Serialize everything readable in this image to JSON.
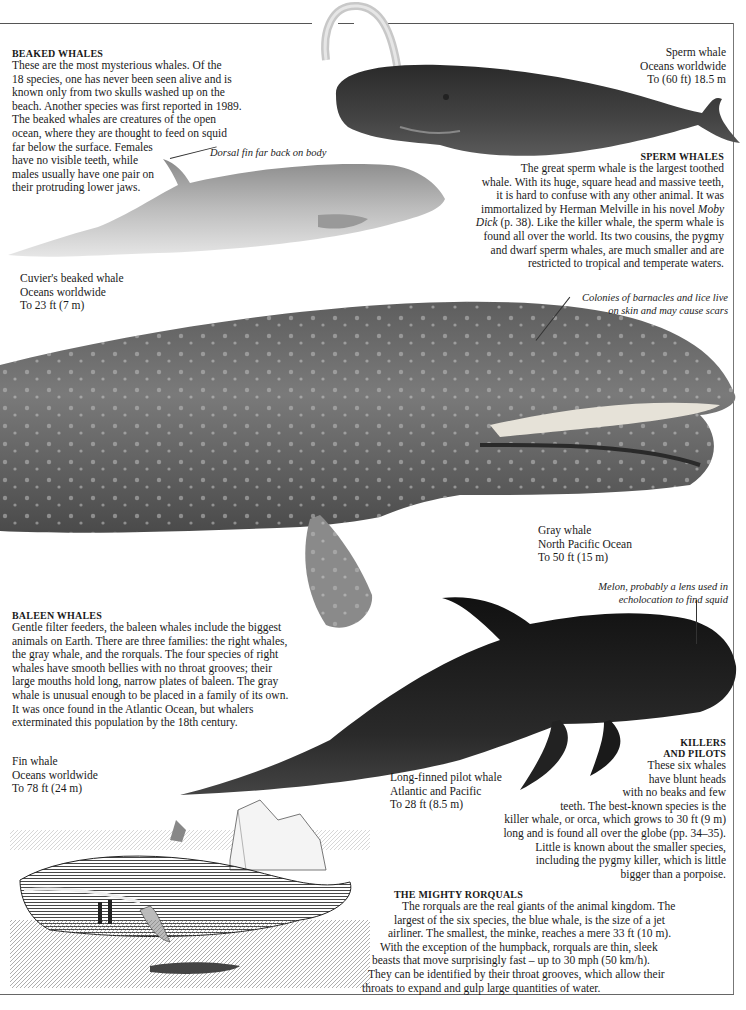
{
  "sections": {
    "beaked": {
      "heading": "BEAKED WHALES",
      "lines": [
        "These are the most mysterious whales. Of the",
        "18 species, one has never been seen alive and is",
        "known only from two skulls washed up on the",
        "beach. Another species was first reported in 1989.",
        "The beaked whales are creatures of the open",
        "ocean, where they are thought to feed on squid",
        "far below the surface. Females",
        "have no visible teeth, while",
        "males usually have one pair on",
        "their protruding lower jaws."
      ]
    },
    "sperm": {
      "heading": "SPERM WHALES",
      "lines": [
        "The great sperm whale is the largest toothed",
        "whale. With its huge, square head and massive teeth,",
        "it is hard to confuse with any other animal. It was",
        "immortalized by Herman Melville in his novel",
        "Moby",
        "Dick",
        " (p. 38). Like the killer whale, the sperm whale is",
        "found all over the world. Its two cousins, the pygmy",
        "and dwarf sperm whales, are much smaller and are",
        "restricted to tropical and temperate waters."
      ]
    },
    "baleen": {
      "heading": "BALEEN WHALES",
      "lines": [
        "Gentle filter feeders, the baleen whales include the biggest",
        "animals on Earth. There are three families: the right whales,",
        "the gray whale, and the rorquals. The four species of right",
        "whales have smooth bellies with no throat grooves; their",
        "large mouths hold long, narrow plates of baleen. The gray",
        "whale is unusual enough to be placed in a family of its own.",
        "It was once found in the Atlantic Ocean, but whalers",
        "exterminated this population by the 18th century."
      ]
    },
    "killers": {
      "heading_1": "KILLERS",
      "heading_2": "AND PILOTS",
      "lines": [
        "These six whales",
        "have blunt heads",
        "with no beaks and few",
        "teeth. The best-known species is the",
        "killer whale, or orca, which grows to 30 ft (9 m)",
        "long and is found all over the globe (pp. 34–35).",
        "Little is known about the smaller species,",
        "including the pygmy killer, which is little",
        "bigger than a porpoise."
      ]
    },
    "rorquals": {
      "heading": "THE MIGHTY RORQUALS",
      "lines": [
        "The rorquals are the real giants of the animal kingdom. The",
        "largest of the six species, the blue whale, is the size of a jet",
        "airliner. The smallest, the minke, reaches a mere 33 ft (10 m).",
        "With the exception of the humpback, rorquals are thin, sleek",
        "beasts that move surprisingly fast – up to 30 mph (50 km/h).",
        "They can be identified by their throat grooves, which allow their",
        "throats to expand and gulp large quantities of water."
      ]
    }
  },
  "captions": {
    "sperm_whale": [
      "Sperm whale",
      "Oceans worldwide",
      "To (60 ft) 18.5 m"
    ],
    "cuviers": [
      "Cuvier's beaked whale",
      "Oceans worldwide",
      "To 23 ft (7 m)"
    ],
    "gray_whale": [
      "Gray whale",
      "North Pacific Ocean",
      "To 50 ft (15 m)"
    ],
    "fin_whale": [
      "Fin whale",
      "Oceans worldwide",
      "To 78 ft (24 m)"
    ],
    "pilot_whale": [
      "Long-finned pilot whale",
      "Atlantic and Pacific",
      "To 28 ft (8.5 m)"
    ]
  },
  "annotations": {
    "dorsal_fin": "Dorsal fin far back on body",
    "barnacles": [
      "Colonies of barnacles and lice live",
      "on skin and may cause scars"
    ],
    "melon": [
      "Melon, probably a lens used in",
      "echolocation to find squid"
    ]
  },
  "colors": {
    "ink": "#1a1a1a",
    "rule": "#555555",
    "gray_whale_body": "#6e6e6e",
    "pilot_whale_body": "#1c1c1c",
    "sperm_whale_body": "#3a3a3a",
    "beaked_whale_body": "#b8b8b8"
  }
}
